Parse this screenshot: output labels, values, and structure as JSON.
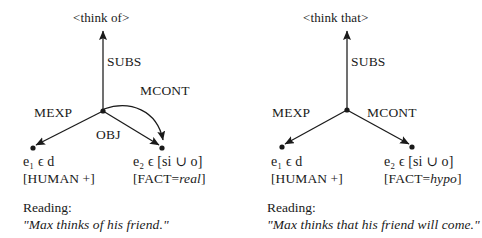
{
  "figure": {
    "background": "#ffffff",
    "ink": "#1a1a1a"
  },
  "diagrams": [
    {
      "id": "think-of",
      "root": {
        "label": "<think of>"
      },
      "edges": [
        {
          "name": "SUBS",
          "label": "SUBS"
        },
        {
          "name": "MEXP",
          "label": "MEXP"
        },
        {
          "name": "OBJ",
          "label": "OBJ"
        },
        {
          "name": "MCONT",
          "label": "MCONT"
        }
      ],
      "nodes": [
        {
          "id": "e1",
          "var": "e",
          "sub": "1",
          "member": "ϵ d",
          "term": "e₁ ϵ d",
          "features": "[HUMAN +]"
        },
        {
          "id": "e2",
          "var": "e",
          "sub": "2",
          "member": "ϵ [si ∪ o]",
          "term": "e₂ ϵ [si ∪ o]",
          "features_prefix": "[FACT=",
          "features_value": "real",
          "features_suffix": "]",
          "features": "[FACT=real]"
        }
      ],
      "reading": {
        "heading": "Reading:",
        "text": "\"Max thinks of his friend.\""
      }
    },
    {
      "id": "think-that",
      "root": {
        "label": "<think that>"
      },
      "edges": [
        {
          "name": "SUBS",
          "label": "SUBS"
        },
        {
          "name": "MEXP",
          "label": "MEXP"
        },
        {
          "name": "MCONT",
          "label": "MCONT"
        }
      ],
      "nodes": [
        {
          "id": "e1",
          "var": "e",
          "sub": "1",
          "member": "ϵ d",
          "term": "e₁ ϵ d",
          "features": "[HUMAN +]"
        },
        {
          "id": "e2",
          "var": "e",
          "sub": "2",
          "member": "ϵ [si ∪ o]",
          "term": "e₂ ϵ [si ∪ o]",
          "features_prefix": "[FACT=",
          "features_value": "hypo",
          "features_suffix": "]",
          "features": "[FACT=hypo]"
        }
      ],
      "reading": {
        "heading": "Reading:",
        "text": "\"Max thinks that his friend will come.\""
      }
    }
  ]
}
